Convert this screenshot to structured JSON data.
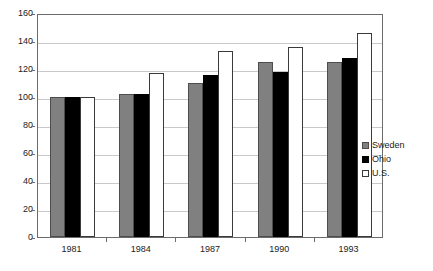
{
  "chart_data": {
    "type": "bar",
    "title": "",
    "subtitle": "",
    "xlabel": "",
    "ylabel": "",
    "categories": [
      "1981",
      "1984",
      "1987",
      "1990",
      "1993"
    ],
    "series": [
      {
        "name": "Sweden",
        "color": "#808080",
        "values": [
          100,
          102,
          110,
          125,
          125
        ]
      },
      {
        "name": "Ohio",
        "color": "#000000",
        "values": [
          100,
          102,
          116,
          118,
          128
        ]
      },
      {
        "name": "U.S.",
        "color": "#ffffff",
        "values": [
          100,
          117,
          133,
          136,
          146
        ]
      }
    ],
    "ylim": [
      0,
      160
    ],
    "ytick_step": 20,
    "yticks": [
      0,
      20,
      40,
      60,
      80,
      100,
      120,
      140,
      160
    ],
    "ytick_labels": [
      "0",
      "20",
      "40",
      "60",
      "80",
      "100",
      "120",
      "140",
      "160"
    ],
    "grid": "horizontal",
    "legend_position": "right-center",
    "legend": [
      "Sweden",
      "Ohio",
      "U.S."
    ]
  },
  "colors": {
    "sweden_fill": "#808080",
    "ohio_fill": "#000000",
    "us_fill": "#ffffff",
    "bar_outline": "#3a3a3a",
    "gridline": "#c9c9c9",
    "axis": "#6b6b6b",
    "background": "#ffffff",
    "text": "#222222"
  }
}
